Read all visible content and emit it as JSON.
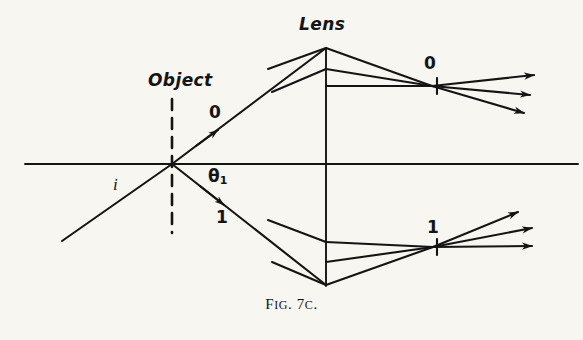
{
  "figure": {
    "caption_prefix": "F",
    "caption_small": "IG",
    "caption_rest": ". 7",
    "caption_small2": "C",
    "caption_end": ".",
    "caption_full": "FIG. 7C.",
    "background_color": "#f8f6f1",
    "ink_color": "#141414"
  },
  "labels": {
    "object": "Object",
    "lens": "Lens",
    "ray_zero_source": "0",
    "ray_one_source": "1",
    "ray_zero_image": "0",
    "ray_one_image": "1",
    "incident_ray": "i",
    "angle_theta": "θ",
    "angle_theta_subscript": "1"
  },
  "diagram": {
    "type": "optical-ray-diagram",
    "optical_axis": {
      "x1": 25,
      "y1": 164,
      "x2": 578,
      "y2": 164
    },
    "lens_plane": {
      "x1": 326,
      "y1": 48,
      "x2": 326,
      "y2": 286
    },
    "object_plane_dashed": {
      "x": 172,
      "y1": 99,
      "y2": 233
    },
    "object_point": {
      "x": 172,
      "y": 164
    },
    "focus_zero": {
      "x": 432,
      "y": 86
    },
    "focus_one": {
      "x": 433,
      "y": 247
    },
    "incident_ray": {
      "x1": 62,
      "y1": 241,
      "x2": 172,
      "y2": 164
    },
    "ray_zero": {
      "x1": 172,
      "y1": 164,
      "x2": 326,
      "y2": 48
    },
    "ray_one": {
      "x1": 172,
      "y1": 164,
      "x2": 326,
      "y2": 285
    },
    "upper_parallel_rays": [
      {
        "x1": 268,
        "y1": 69,
        "x2": 326,
        "y2": 48
      },
      {
        "x1": 272,
        "y1": 92,
        "x2": 326,
        "y2": 69
      }
    ],
    "upper_converging_rays": [
      {
        "x1": 326,
        "y1": 48,
        "x2": 432,
        "y2": 86
      },
      {
        "x1": 326,
        "y1": 69,
        "x2": 432,
        "y2": 86
      },
      {
        "x1": 326,
        "y1": 86,
        "x2": 432,
        "y2": 86
      }
    ],
    "upper_output_arrows": [
      {
        "x1": 432,
        "y1": 86,
        "x2": 534,
        "y2": 75
      },
      {
        "x1": 432,
        "y1": 86,
        "x2": 530,
        "y2": 93
      },
      {
        "x1": 432,
        "y1": 86,
        "x2": 525,
        "y2": 112
      }
    ],
    "lower_parallel_rays": [
      {
        "x1": 268,
        "y1": 220,
        "x2": 326,
        "y2": 242
      },
      {
        "x1": 272,
        "y1": 262,
        "x2": 326,
        "y2": 285
      }
    ],
    "lower_converging_rays": [
      {
        "x1": 326,
        "y1": 242,
        "x2": 433,
        "y2": 247
      },
      {
        "x1": 326,
        "y1": 262,
        "x2": 433,
        "y2": 247
      },
      {
        "x1": 326,
        "y1": 285,
        "x2": 433,
        "y2": 247
      }
    ],
    "lower_output_arrows": [
      {
        "x1": 433,
        "y1": 247,
        "x2": 516,
        "y2": 212
      },
      {
        "x1": 433,
        "y1": 247,
        "x2": 530,
        "y2": 230
      },
      {
        "x1": 433,
        "y1": 247,
        "x2": 530,
        "y2": 246
      }
    ],
    "mid_ray_arrows": [
      {
        "x": 216,
        "y": 131,
        "angle": -37
      },
      {
        "x": 222,
        "y": 203,
        "angle": 38
      }
    ]
  }
}
